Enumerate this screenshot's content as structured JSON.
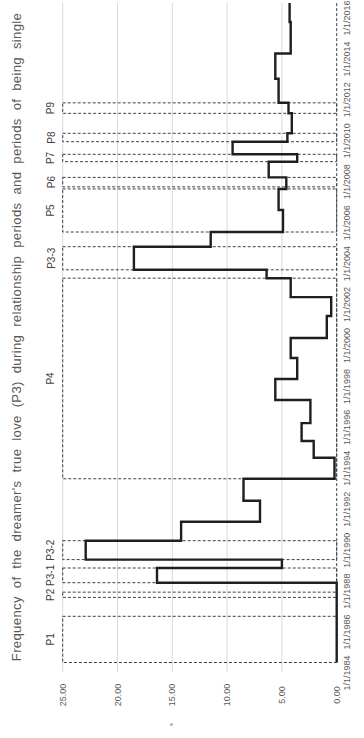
{
  "colors": {
    "background": "#ffffff",
    "line": "#1f1f1f",
    "period_box_border": "#404040",
    "gridline": "#d9d9d9",
    "axis_label": "#595959",
    "title": "#595959",
    "period_label": "#404040"
  },
  "chart_data": {
    "type": "line",
    "style": "step",
    "orientation": "landscape chart rotated 90 degrees counter-clockwise (portrait display)",
    "title": "Frequency of the dreamer's true love (P3) during relationship periods and periods of being single",
    "grid": "value gridlines only, light gray",
    "legend": "none",
    "value_axis": {
      "range": [
        0,
        25
      ],
      "ticks": [
        25,
        20,
        15,
        10,
        5,
        0
      ],
      "tick_labels": [
        "25.00",
        "20.00",
        "15.00",
        "10.00",
        "5.00",
        "0.00"
      ]
    },
    "date_axis": {
      "range_years": [
        1984,
        2017
      ],
      "tick_years": [
        1984,
        1986,
        1988,
        1990,
        1992,
        1994,
        1996,
        1998,
        2000,
        2002,
        2004,
        2006,
        2008,
        2010,
        2012,
        2014,
        2016
      ],
      "tick_labels": [
        "1/1/1984",
        "1/1/1986",
        "1/1/1988",
        "1/1/1990",
        "1/1/1992",
        "1/1/1994",
        "1/1/1996",
        "1/1/1998",
        "1/1/2000",
        "1/1/2002",
        "1/1/2004",
        "1/1/2006",
        "1/1/2008",
        "1/1/2010",
        "1/1/2012",
        "1/1/2014",
        "1/1/2016"
      ]
    },
    "periods": [
      {
        "label": "P1",
        "start": 1985.5,
        "end": 1987.7
      },
      {
        "label": "P2",
        "start": 1988.6,
        "end": 1988.85
      },
      {
        "label": "P3-1",
        "start": 1989.3,
        "end": 1990.0
      },
      {
        "label": "P3-2",
        "start": 1990.4,
        "end": 1991.3
      },
      {
        "label": "P4",
        "start": 1994.25,
        "end": 2003.8
      },
      {
        "label": "P3-3",
        "start": 2004.2,
        "end": 2005.3
      },
      {
        "label": "P5",
        "start": 2006.0,
        "end": 2008.05
      },
      {
        "label": "P6",
        "start": 2008.15,
        "end": 2008.6
      },
      {
        "label": "P7",
        "start": 2009.35,
        "end": 2009.7
      },
      {
        "label": "P8",
        "start": 2010.3,
        "end": 2010.7
      },
      {
        "label": "P9",
        "start": 2011.65,
        "end": 2012.15
      }
    ],
    "series": {
      "name": "frequency of dreams about P3",
      "end_year": 2016.9,
      "points": [
        {
          "year": 1985.5,
          "value": 0
        },
        {
          "year": 1989.3,
          "value": 16.4
        },
        {
          "year": 1990.0,
          "value": 5.0
        },
        {
          "year": 1990.4,
          "value": 22.9
        },
        {
          "year": 1991.3,
          "value": 14.2
        },
        {
          "year": 1992.2,
          "value": 7.0
        },
        {
          "year": 1993.2,
          "value": 8.5
        },
        {
          "year": 1994.25,
          "value": 0.2
        },
        {
          "year": 1995.25,
          "value": 2.1
        },
        {
          "year": 1996.05,
          "value": 3.2
        },
        {
          "year": 1996.9,
          "value": 2.4
        },
        {
          "year": 1998.0,
          "value": 5.6
        },
        {
          "year": 1999.0,
          "value": 3.6
        },
        {
          "year": 2000.0,
          "value": 4.2
        },
        {
          "year": 2000.95,
          "value": 0.9
        },
        {
          "year": 2002.0,
          "value": 0.5
        },
        {
          "year": 2002.9,
          "value": 4.2
        },
        {
          "year": 2003.8,
          "value": 6.4
        },
        {
          "year": 2004.2,
          "value": 18.5
        },
        {
          "year": 2005.3,
          "value": 11.5
        },
        {
          "year": 2006.0,
          "value": 4.9
        },
        {
          "year": 2007.05,
          "value": 5.3
        },
        {
          "year": 2008.05,
          "value": 4.6
        },
        {
          "year": 2008.6,
          "value": 6.2
        },
        {
          "year": 2009.35,
          "value": 3.6
        },
        {
          "year": 2009.7,
          "value": 9.5
        },
        {
          "year": 2010.3,
          "value": 4.5
        },
        {
          "year": 2010.7,
          "value": 4.1
        },
        {
          "year": 2011.65,
          "value": 4.4
        },
        {
          "year": 2012.15,
          "value": 5.3
        },
        {
          "year": 2013.3,
          "value": 5.6
        },
        {
          "year": 2014.5,
          "value": 4.2
        },
        {
          "year": 2016.0,
          "value": 4.3
        }
      ]
    },
    "baseline": {
      "value": 0,
      "start_year": 1985.5,
      "end_year": 2016.9,
      "style": "dashed"
    }
  }
}
